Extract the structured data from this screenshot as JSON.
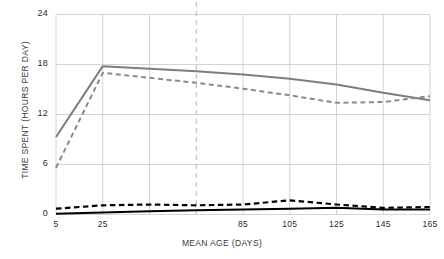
{
  "chart_data": {
    "type": "line",
    "title": "",
    "xlabel": "MEAN AGE (DAYS)",
    "ylabel": "TIME SPENT (HOURS PER DAY)",
    "xlim": [
      5,
      165
    ],
    "ylim": [
      0,
      24
    ],
    "yticks": [
      0,
      6,
      12,
      18,
      24
    ],
    "ytick_labels": [
      "0",
      "6",
      "12",
      "18",
      "24"
    ],
    "xticks": [
      5,
      25,
      45,
      65,
      85,
      105,
      125,
      145,
      165
    ],
    "xtick_labels": [
      "5",
      "25",
      "",
      "",
      "85",
      "105",
      "125",
      "145",
      "165"
    ],
    "grid": true,
    "legend": "none",
    "annotations": [
      {
        "type": "vertical-dashed-line",
        "x": 65,
        "color": "#b4b4b4"
      }
    ],
    "x": [
      5,
      25,
      45,
      65,
      85,
      105,
      125,
      145,
      165
    ],
    "series": [
      {
        "name": "gray-solid",
        "style": "solid",
        "color": "#7d7d7d",
        "width": 2.0,
        "values": [
          9.3,
          17.8,
          17.5,
          17.2,
          16.8,
          16.3,
          15.6,
          14.6,
          13.7
        ]
      },
      {
        "name": "gray-dashed",
        "style": "dashed",
        "color": "#8a8a8a",
        "width": 2.0,
        "values": [
          5.6,
          17.0,
          16.4,
          15.8,
          15.1,
          14.3,
          13.4,
          13.5,
          14.2
        ]
      },
      {
        "name": "black-dashed",
        "style": "dashed",
        "color": "#000000",
        "width": 2.2,
        "values": [
          0.7,
          1.1,
          1.2,
          1.1,
          1.2,
          1.7,
          1.2,
          0.8,
          0.9
        ]
      },
      {
        "name": "black-solid",
        "style": "solid",
        "color": "#000000",
        "width": 2.0,
        "values": [
          0.1,
          0.25,
          0.4,
          0.5,
          0.6,
          0.7,
          0.8,
          0.6,
          0.6
        ]
      }
    ]
  },
  "axes": {
    "x_title": "MEAN AGE (DAYS)",
    "y_title": "TIME SPENT (HOURS PER DAY)"
  }
}
